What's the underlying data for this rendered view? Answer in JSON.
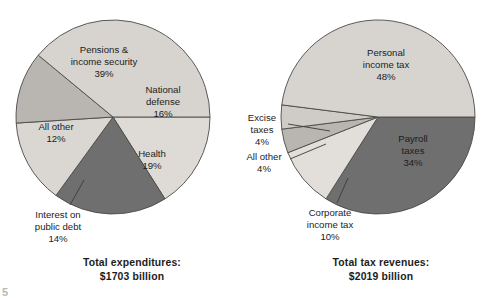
{
  "figure": {
    "background_color": "#ffffff",
    "outline_color": "#4a4a4a",
    "text_color": "#1c1c1c",
    "corner_mark": "5"
  },
  "chart_data": [
    {
      "type": "pie",
      "id": "federal-expenditures",
      "title": "Total expenditures:",
      "subtitle": "$2019 billion",
      "caption_line1": "Total expenditures:",
      "caption_line2": "$1703 billion",
      "total_label": "Total expenditures",
      "total_value": "$1703 billion",
      "xlabel": "",
      "ylabel": "",
      "legend": "none",
      "grid": false,
      "start_angle_deg": 0,
      "direction": "clockwise",
      "categories": [
        "National defense",
        "Health",
        "Interest on public debt",
        "All other",
        "Pensions & income security"
      ],
      "values": [
        16,
        19,
        14,
        12,
        39
      ],
      "slices": [
        {
          "name": "National defense",
          "label_lines": [
            "National",
            "defense",
            "16%"
          ],
          "value": 16,
          "unit": "%",
          "color": "#dedbd6",
          "label_placement": "inside",
          "label_x": 163,
          "label_y": 96
        },
        {
          "name": "Health",
          "label_lines": [
            "Health",
            "19%"
          ],
          "value": 19,
          "unit": "%",
          "color": "#6f6f6f",
          "label_placement": "inside",
          "label_x": 152,
          "label_y": 160
        },
        {
          "name": "Interest on public debt",
          "label_lines": [
            "Interest on",
            "public debt",
            "14%"
          ],
          "value": 14,
          "unit": "%",
          "color": "#dad7d2",
          "label_placement": "callout",
          "label_x": 58,
          "label_y": 221
        },
        {
          "name": "All other",
          "label_lines": [
            "All other",
            "12%"
          ],
          "value": 12,
          "unit": "%",
          "color": "#b9b6b1",
          "label_placement": "inside",
          "label_x": 56,
          "label_y": 133
        },
        {
          "name": "Pensions & income security",
          "label_lines": [
            "Pensions &",
            "income security",
            "39%"
          ],
          "value": 39,
          "unit": "%",
          "color": "#d7d4cf",
          "label_placement": "inside",
          "label_x": 103,
          "label_y": 56
        }
      ]
    },
    {
      "type": "pie",
      "id": "federal-tax-revenues",
      "title": "Total tax revenues:",
      "subtitle": "$2019 billion",
      "caption_line1": "Total tax revenues:",
      "caption_line2": "$2019 billion",
      "total_label": "Total tax revenues",
      "total_value": "$2019 billion",
      "xlabel": "",
      "ylabel": "",
      "legend": "none",
      "grid": false,
      "start_angle_deg": 0,
      "direction": "clockwise",
      "categories": [
        "Payroll taxes",
        "Corporate income tax",
        "All other",
        "Excise taxes",
        "Personal income tax"
      ],
      "values": [
        34,
        10,
        4,
        4,
        48
      ],
      "slices": [
        {
          "name": "Payroll taxes",
          "label_lines": [
            "Payroll",
            "taxes",
            "34%"
          ],
          "value": 34,
          "unit": "%",
          "color": "#6f6f6f",
          "label_placement": "inside",
          "label_x": 412,
          "label_y": 145
        },
        {
          "name": "Corporate income tax",
          "label_lines": [
            "Corporate",
            "income tax",
            "10%"
          ],
          "value": 10,
          "unit": "%",
          "color": "#e2dfda",
          "label_placement": "callout",
          "label_x": 330,
          "label_y": 219
        },
        {
          "name": "All other",
          "label_lines": [
            "All other",
            "4%"
          ],
          "value": 4,
          "unit": "%",
          "color": "#b9b6b1",
          "label_placement": "callout",
          "label_x": 264,
          "label_y": 163
        },
        {
          "name": "Excise taxes",
          "label_lines": [
            "Excise",
            "taxes",
            "4%"
          ],
          "value": 4,
          "unit": "%",
          "color": "#cfccc7",
          "label_placement": "callout",
          "label_x": 262,
          "label_y": 124
        },
        {
          "name": "Personal income tax",
          "label_lines": [
            "Personal",
            "income tax",
            "48%"
          ],
          "value": 48,
          "unit": "%",
          "color": "#d7d4cf",
          "label_placement": "inside",
          "label_x": 385,
          "label_y": 59
        }
      ]
    }
  ]
}
